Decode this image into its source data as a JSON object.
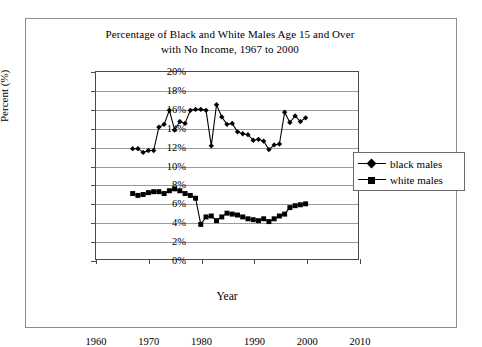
{
  "chart_data": {
    "type": "line",
    "title": "Percentage of Black and White Males Age 15 and Over with No Income, 1967 to 2000",
    "title_lines": [
      "Percentage of Black and White Males Age 15 and Over",
      "with No Income, 1967 to 2000"
    ],
    "xlabel": "Year",
    "ylabel": "Percent (%)",
    "xlim": [
      1960,
      2010
    ],
    "ylim": [
      0,
      20
    ],
    "grid": true,
    "legend_position": "right",
    "x_ticks": [
      1960,
      1970,
      1980,
      1990,
      2000,
      2010
    ],
    "x_tick_labels": [
      "1960",
      "1970",
      "1980",
      "1990",
      "2000",
      "2010"
    ],
    "y_ticks": [
      0,
      2,
      4,
      6,
      8,
      10,
      12,
      14,
      16,
      18,
      20
    ],
    "y_tick_labels": [
      "0%",
      "2%",
      "4%",
      "6%",
      "8%",
      "10%",
      "12%",
      "14%",
      "16%",
      "18%",
      "20%"
    ],
    "x": [
      1967,
      1968,
      1969,
      1970,
      1971,
      1972,
      1973,
      1974,
      1975,
      1976,
      1977,
      1978,
      1979,
      1980,
      1981,
      1982,
      1983,
      1984,
      1985,
      1986,
      1987,
      1988,
      1989,
      1990,
      1991,
      1992,
      1993,
      1994,
      1995,
      1996,
      1997,
      1998,
      1999,
      2000
    ],
    "series": [
      {
        "name": "black males",
        "marker": "diamond",
        "values": [
          11.8,
          11.8,
          11.4,
          11.6,
          11.6,
          14.1,
          14.4,
          15.9,
          13.8,
          14.7,
          14.5,
          15.9,
          16.0,
          16.0,
          15.9,
          12.1,
          16.5,
          15.2,
          14.4,
          14.5,
          13.6,
          13.4,
          13.3,
          12.7,
          12.8,
          12.6,
          11.7,
          12.2,
          12.3,
          15.7,
          14.6,
          15.3,
          14.7,
          15.1
        ]
      },
      {
        "name": "white males",
        "marker": "square",
        "values": [
          7.0,
          6.8,
          6.9,
          7.1,
          7.2,
          7.2,
          7.0,
          7.3,
          7.5,
          7.3,
          7.0,
          6.8,
          6.5,
          3.7,
          4.5,
          4.6,
          4.1,
          4.5,
          4.9,
          4.8,
          4.7,
          4.5,
          4.3,
          4.2,
          4.1,
          4.3,
          4.0,
          4.3,
          4.6,
          4.8,
          5.5,
          5.7,
          5.8,
          5.9
        ]
      }
    ]
  },
  "legend": {
    "items": [
      {
        "label": "black males",
        "marker": "diamond"
      },
      {
        "label": "white males",
        "marker": "square"
      }
    ]
  }
}
